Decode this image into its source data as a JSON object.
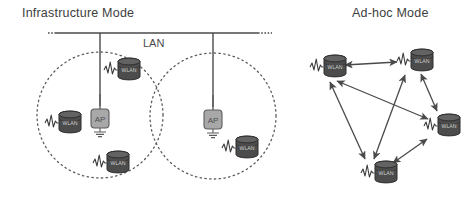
{
  "diagram": {
    "title_left": "Infrastructure Mode",
    "title_right": "Ad-hoc Mode",
    "lan_label": "LAN",
    "ap_label": "AP",
    "station_label": "WLAN",
    "colors": {
      "line": "#4a4a4a",
      "dotted": "#5a5a5a",
      "ap_fill": "#a8a8a8",
      "ap_stroke": "#5c5c5c",
      "station_fill": "#4c4c4c",
      "station_stroke": "#2e2e2e",
      "text": "#3d3d3d",
      "background": "#ffffff"
    },
    "infrastructure": {
      "bus": {
        "x1": 48,
        "x2": 272,
        "y": 33,
        "dash_ends": true
      },
      "drops": [
        {
          "x": 100,
          "y1": 33,
          "y2": 106
        },
        {
          "x": 213,
          "y1": 33,
          "y2": 106
        }
      ],
      "cells": [
        {
          "name": "cell-left",
          "cx": 100,
          "cy": 115,
          "r": 63
        },
        {
          "name": "cell-right",
          "cx": 213,
          "cy": 116,
          "r": 63
        }
      ],
      "access_points": [
        {
          "name": "ap-left",
          "x": 100,
          "y": 118
        },
        {
          "name": "ap-right",
          "x": 213,
          "y": 119
        }
      ],
      "stations": [
        {
          "name": "station-left-west",
          "x": 62,
          "y": 123
        },
        {
          "name": "station-left-northeast",
          "x": 121,
          "y": 70
        },
        {
          "name": "station-left-south",
          "x": 110,
          "y": 163
        },
        {
          "name": "station-right-southeast",
          "x": 239,
          "y": 148
        }
      ]
    },
    "adhoc": {
      "nodes": [
        {
          "name": "node-top-left",
          "x": 327,
          "y": 67
        },
        {
          "name": "node-top-right",
          "x": 414,
          "y": 61
        },
        {
          "name": "node-right",
          "x": 441,
          "y": 126
        },
        {
          "name": "node-bottom",
          "x": 378,
          "y": 173
        }
      ],
      "links": [
        {
          "from": "node-top-left",
          "to": "node-top-right",
          "arrows": "both"
        },
        {
          "from": "node-top-right",
          "to": "node-right",
          "arrows": "both"
        },
        {
          "from": "node-right",
          "to": "node-bottom",
          "arrows": "both"
        },
        {
          "from": "node-bottom",
          "to": "node-top-right",
          "arrows": "both"
        },
        {
          "from": "node-top-left",
          "to": "node-right",
          "arrows": "both"
        },
        {
          "from": "node-top-left",
          "to": "node-bottom",
          "arrows": "both"
        }
      ]
    }
  }
}
